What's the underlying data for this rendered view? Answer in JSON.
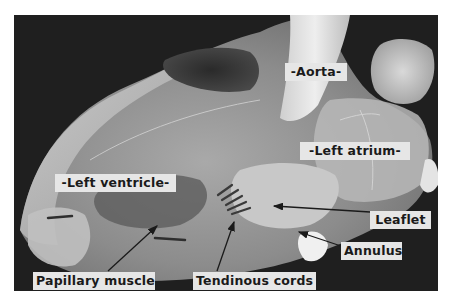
{
  "figure": {
    "colors": {
      "background": "#1f1f1f",
      "label_bg": "#e6e6e6",
      "label_text": "#1a1a1a",
      "arrow": "#1a1a1a",
      "page": "#ffffff"
    },
    "labels": [
      {
        "id": "aorta",
        "text": "-Aorta-"
      },
      {
        "id": "left-atrium",
        "text": "-Left atrium-"
      },
      {
        "id": "left-ventricle",
        "text": "-Left ventricle-"
      },
      {
        "id": "leaflet",
        "text": "Leaflet"
      },
      {
        "id": "annulus",
        "text": "Annulus"
      },
      {
        "id": "papillary-muscle",
        "text": "Papillary muscle"
      },
      {
        "id": "tendinous-cords",
        "text": "Tendinous cords"
      }
    ]
  }
}
